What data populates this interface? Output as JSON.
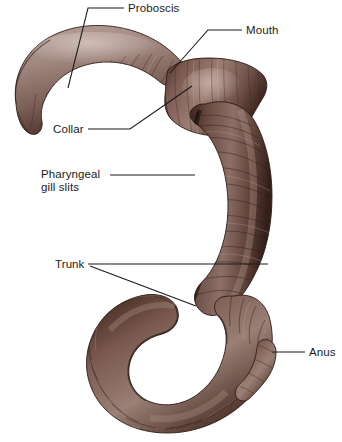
{
  "figure": {
    "background_color": "#ffffff",
    "organism": "acorn worm"
  },
  "palette": {
    "body_light": "#a89089",
    "body_mid": "#7d5b51",
    "body_dark": "#4a2f28",
    "body_darkest": "#3a241f",
    "highlight": "#c9b3ac",
    "outline": "#2e1d19",
    "label_color": "#1b1b1b",
    "leader_color": "#1a1a1a"
  },
  "labels": [
    {
      "id": "proboscis",
      "name": "Proboscis",
      "text": "Proboscis",
      "text_x": 128,
      "text_y": 12,
      "anchor": "start",
      "lines": [
        [
          [
            124,
            8
          ],
          [
            88,
            8
          ],
          [
            68,
            88
          ]
        ]
      ]
    },
    {
      "id": "mouth",
      "name": "Mouth",
      "text": "Mouth",
      "text_x": 246,
      "text_y": 34,
      "anchor": "start",
      "lines": [
        [
          [
            242,
            30
          ],
          [
            208,
            30
          ],
          [
            170,
            73
          ]
        ]
      ]
    },
    {
      "id": "collar",
      "name": "Collar",
      "text": "Collar",
      "text_x": 53,
      "text_y": 133,
      "anchor": "start",
      "lines": [
        [
          [
            88,
            129
          ],
          [
            130,
            129
          ],
          [
            192,
            86
          ]
        ]
      ]
    },
    {
      "id": "pharyngeal-gill-slits",
      "name": "Pharyngeal gill slits",
      "text": "Pharyngeal",
      "text2": "gill slits",
      "text_x": 41,
      "text_y": 178,
      "text2_y": 191,
      "anchor": "start",
      "lines": [
        [
          [
            110,
            175
          ],
          [
            195,
            175
          ]
        ]
      ]
    },
    {
      "id": "trunk",
      "name": "Trunk",
      "text": "Trunk",
      "text_x": 55,
      "text_y": 268,
      "anchor": "start",
      "lines": [
        [
          [
            88,
            264
          ],
          [
            268,
            264
          ]
        ],
        [
          [
            90,
            266
          ],
          [
            196,
            306
          ]
        ]
      ]
    },
    {
      "id": "anus",
      "name": "Anus",
      "text": "Anus",
      "text_x": 309,
      "text_y": 356,
      "anchor": "start",
      "lines": [
        [
          [
            305,
            352
          ],
          [
            272,
            352
          ]
        ]
      ]
    }
  ]
}
